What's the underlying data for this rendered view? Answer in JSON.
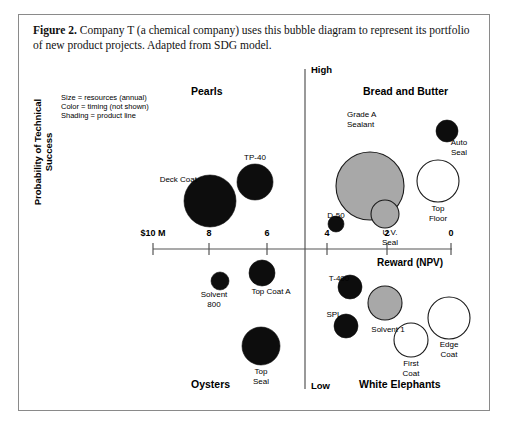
{
  "caption": {
    "figure_number": "Figure 2.",
    "text": " Company T (a chemical company) uses this bubble diagram to represent its portfolio of new product projects. Adapted from SDG model."
  },
  "legend": {
    "line1": "Size = resources (annual)",
    "line2": "Color = timing (not shown)",
    "line3": "Shading = product line"
  },
  "axes": {
    "y_title": "Probability of Technical Success",
    "y_high": "High",
    "y_low": "Low",
    "x_title": "Reward (NPV)",
    "x_unit_label": "$10 M",
    "x_ticks": [
      "$10 M",
      "8",
      "6",
      "4",
      "2",
      "0"
    ]
  },
  "quadrants": {
    "top_left": "Pearls",
    "top_right": "Bread and Butter",
    "bottom_left": "Oysters",
    "bottom_right": "White Elephants"
  },
  "colors": {
    "black": "#0d0d0d",
    "gray": "#a8a8a8",
    "white": "#ffffff",
    "outline": "#1a1a1a",
    "frame": "#8a8a8a",
    "axis": "#555555"
  },
  "chart_data": {
    "type": "scatter",
    "xlabel": "Reward (NPV)",
    "ylabel": "Probability of Technical Success",
    "xlim": [
      10,
      0
    ],
    "ylim": [
      "Low",
      "High"
    ],
    "grid": false,
    "legend_position": "top-left",
    "quadrants": [
      "Pearls",
      "Bread and Butter",
      "Oysters",
      "White Elephants"
    ],
    "encoding": {
      "size": "resources (annual)",
      "color": "timing (not shown)",
      "shading": "product line"
    },
    "bubbles": [
      {
        "label": "Deck Coat",
        "quadrant": "Pearls",
        "x": 8.0,
        "y": "high",
        "fill": "black",
        "cx": 191,
        "cy": 186,
        "r": 26,
        "lx": 178,
        "ly": 160,
        "lalign": "right"
      },
      {
        "label": "TP-40",
        "quadrant": "Pearls",
        "x": 6.9,
        "y": "high",
        "fill": "black",
        "cx": 236,
        "cy": 167,
        "r": 18,
        "lx": 236,
        "ly": 138,
        "lalign": "center"
      },
      {
        "label": "Solvent\n800",
        "quadrant": "Oysters",
        "x": 7.9,
        "y": "low",
        "fill": "black",
        "cx": 201,
        "cy": 266,
        "r": 9,
        "lx": 195,
        "ly": 275,
        "lalign": "center"
      },
      {
        "label": "Top Coat A",
        "quadrant": "Oysters",
        "x": 6.7,
        "y": "low",
        "fill": "black",
        "cx": 243,
        "cy": 258,
        "r": 13,
        "lx": 252,
        "ly": 272,
        "lalign": "center"
      },
      {
        "label": "Top\nSeal",
        "quadrant": "Oysters",
        "x": 6.6,
        "y": "low",
        "fill": "black",
        "cx": 242,
        "cy": 331,
        "r": 19,
        "lx": 242,
        "ly": 352,
        "lalign": "center"
      },
      {
        "label": "Grade A\nSealant",
        "quadrant": "Bread and Butter",
        "x": 3.6,
        "y": "high",
        "fill": "gray",
        "cx": 351,
        "cy": 171,
        "r": 34,
        "lx": 328,
        "ly": 95,
        "lalign": "left"
      },
      {
        "label": "Auto\nSeal",
        "quadrant": "Bread and Butter",
        "x": 0.9,
        "y": "high",
        "fill": "black",
        "cx": 428,
        "cy": 116,
        "r": 11,
        "lx": 440,
        "ly": 123,
        "lalign": "center"
      },
      {
        "label": "Top\nFloor",
        "quadrant": "Bread and Butter",
        "x": 1.2,
        "y": "high",
        "fill": "white",
        "cx": 419,
        "cy": 166,
        "r": 21,
        "lx": 419,
        "ly": 189,
        "lalign": "center"
      },
      {
        "label": "D-50",
        "quadrant": "Bread and Butter",
        "x": 4.1,
        "y": "high",
        "fill": "black",
        "cx": 317,
        "cy": 209,
        "r": 8,
        "lx": 317,
        "ly": 196,
        "lalign": "center"
      },
      {
        "label": "U.V.\nSeal",
        "quadrant": "Bread and Butter",
        "x": 3.3,
        "y": "high",
        "fill": "gray",
        "cx": 366,
        "cy": 199,
        "r": 14,
        "lx": 371,
        "ly": 213,
        "lalign": "center"
      },
      {
        "label": "T-400",
        "quadrant": "White Elephants",
        "x": 3.9,
        "y": "low",
        "fill": "black",
        "cx": 331,
        "cy": 272,
        "r": 12,
        "lx": 320,
        "ly": 259,
        "lalign": "center"
      },
      {
        "label": "SPL",
        "quadrant": "White Elephants",
        "x": 4.1,
        "y": "low",
        "fill": "black",
        "cx": 327,
        "cy": 311,
        "r": 12,
        "lx": 315,
        "ly": 295,
        "lalign": "center"
      },
      {
        "label": "Solvent 1",
        "quadrant": "White Elephants",
        "x": 3.3,
        "y": "low",
        "fill": "gray",
        "cx": 366,
        "cy": 288,
        "r": 17,
        "lx": 369,
        "ly": 310,
        "lalign": "center"
      },
      {
        "label": "First\nCoat",
        "quadrant": "White Elephants",
        "x": 2.2,
        "y": "low",
        "fill": "white",
        "cx": 392,
        "cy": 325,
        "r": 17,
        "lx": 392,
        "ly": 344,
        "lalign": "center"
      },
      {
        "label": "Edge\nCoat",
        "quadrant": "White Elephants",
        "x": 1.2,
        "y": "low",
        "fill": "white",
        "cx": 430,
        "cy": 303,
        "r": 21,
        "lx": 430,
        "ly": 325,
        "lalign": "center"
      }
    ]
  }
}
